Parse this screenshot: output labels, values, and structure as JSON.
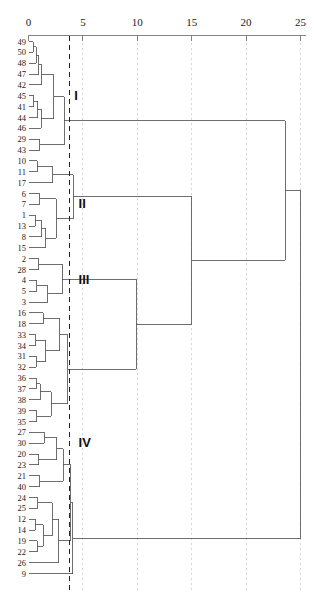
{
  "chart_data": {
    "type": "line",
    "title": "",
    "xlabel": "",
    "ylabel": "",
    "orientation": "horizontal",
    "grid": true,
    "axis_position": "top",
    "xlim": [
      0,
      25.6
    ],
    "axis_ticks": [
      {
        "value": 0,
        "label": "0"
      },
      {
        "value": 5,
        "label": "5"
      },
      {
        "value": 10,
        "label": "10"
      },
      {
        "value": 15,
        "label": "15"
      },
      {
        "value": 20,
        "label": "20"
      },
      {
        "value": 25,
        "label": "25"
      }
    ],
    "leaf_order": [
      "49",
      "50",
      "48",
      "47",
      "42",
      "45",
      "41",
      "44",
      "46",
      "29",
      "43",
      "10",
      "11",
      "17",
      "6",
      "7",
      "1",
      "13",
      "8",
      "15",
      "2",
      "28",
      "4",
      "5",
      "3",
      "16",
      "18",
      "33",
      "34",
      "31",
      "32",
      "36",
      "37",
      "38",
      "39",
      "35",
      "27",
      "30",
      "20",
      "23",
      "21",
      "40",
      "24",
      "25",
      "12",
      "14",
      "19",
      "22",
      "26",
      "9"
    ],
    "n_leaves": 50,
    "cut_line": {
      "value": 3.8,
      "style": "dashed",
      "color": "#222222"
    },
    "cluster_labels": [
      {
        "name": "I",
        "value": 4.2,
        "leaf_span": [
          0,
          10
        ]
      },
      {
        "name": "II",
        "value": 4.6,
        "leaf_span": [
          11,
          19
        ]
      },
      {
        "name": "III",
        "value": 4.6,
        "leaf_span": [
          20,
          24
        ]
      },
      {
        "name": "IV",
        "value": 4.6,
        "leaf_span": [
          25,
          49
        ]
      }
    ],
    "merges": [
      {
        "id": "m1",
        "children": [
          "49",
          "50"
        ],
        "height": 0.45
      },
      {
        "id": "m2",
        "children": [
          "m1",
          "48"
        ],
        "height": 0.7
      },
      {
        "id": "m3",
        "children": [
          "m2",
          "47"
        ],
        "height": 0.95
      },
      {
        "id": "m4",
        "children": [
          "m3",
          "42"
        ],
        "height": 1.2
      },
      {
        "id": "m5",
        "children": [
          "45",
          "41"
        ],
        "height": 0.5
      },
      {
        "id": "m6",
        "children": [
          "m5",
          "44"
        ],
        "height": 0.85
      },
      {
        "id": "m7",
        "children": [
          "m6",
          "46"
        ],
        "height": 1.15
      },
      {
        "id": "m8",
        "children": [
          "m4",
          "m7"
        ],
        "height": 2.3
      },
      {
        "id": "m9",
        "children": [
          "29",
          "43"
        ],
        "height": 1.05
      },
      {
        "id": "m10",
        "children": [
          "m8",
          "m9"
        ],
        "height": 3.3
      },
      {
        "id": "m11",
        "children": [
          "10",
          "11"
        ],
        "height": 0.8
      },
      {
        "id": "m12",
        "children": [
          "m11",
          "17"
        ],
        "height": 2.25
      },
      {
        "id": "m13",
        "children": [
          "6",
          "7"
        ],
        "height": 1.05
      },
      {
        "id": "m14",
        "children": [
          "1",
          "13"
        ],
        "height": 0.6
      },
      {
        "id": "m15",
        "children": [
          "m14",
          "8"
        ],
        "height": 1.2
      },
      {
        "id": "m16",
        "children": [
          "m15",
          "15"
        ],
        "height": 1.6
      },
      {
        "id": "m17",
        "children": [
          "m13",
          "m16"
        ],
        "height": 2.55
      },
      {
        "id": "m18",
        "children": [
          "m12",
          "m17"
        ],
        "height": 4.1
      },
      {
        "id": "m19",
        "children": [
          "2",
          "28"
        ],
        "height": 0.95
      },
      {
        "id": "m20",
        "children": [
          "4",
          "5"
        ],
        "height": 0.75
      },
      {
        "id": "m21",
        "children": [
          "m20",
          "3"
        ],
        "height": 1.75
      },
      {
        "id": "m22",
        "children": [
          "m19",
          "m21"
        ],
        "height": 3.1
      },
      {
        "id": "m23",
        "children": [
          "16",
          "18"
        ],
        "height": 1.35
      },
      {
        "id": "m24",
        "children": [
          "33",
          "34"
        ],
        "height": 0.65
      },
      {
        "id": "m25",
        "children": [
          "31",
          "32"
        ],
        "height": 0.7
      },
      {
        "id": "m26",
        "children": [
          "m24",
          "m25"
        ],
        "height": 1.6
      },
      {
        "id": "m27",
        "children": [
          "m23",
          "m26"
        ],
        "height": 2.85
      },
      {
        "id": "m28",
        "children": [
          "36",
          "37"
        ],
        "height": 0.7
      },
      {
        "id": "m29",
        "children": [
          "m28",
          "38"
        ],
        "height": 1.1
      },
      {
        "id": "m30",
        "children": [
          "39",
          "35"
        ],
        "height": 0.75
      },
      {
        "id": "m31",
        "children": [
          "m29",
          "m30"
        ],
        "height": 2.1
      },
      {
        "id": "m32",
        "children": [
          "m27",
          "m31"
        ],
        "height": 3.6
      },
      {
        "id": "m33",
        "children": [
          "m22",
          "m32"
        ],
        "height": 9.9
      },
      {
        "id": "m34",
        "children": [
          "m18",
          "m33"
        ],
        "height": 15.0
      },
      {
        "id": "m35",
        "children": [
          "27",
          "30"
        ],
        "height": 1.45
      },
      {
        "id": "m36",
        "children": [
          "20",
          "23"
        ],
        "height": 0.95
      },
      {
        "id": "m37",
        "children": [
          "m35",
          "m36"
        ],
        "height": 2.6
      },
      {
        "id": "m38",
        "children": [
          "21",
          "40"
        ],
        "height": 1.05
      },
      {
        "id": "m39",
        "children": [
          "m37",
          "m38"
        ],
        "height": 3.2
      },
      {
        "id": "m40",
        "children": [
          "24",
          "25"
        ],
        "height": 0.85
      },
      {
        "id": "m41",
        "children": [
          "12",
          "14"
        ],
        "height": 0.6
      },
      {
        "id": "m42",
        "children": [
          "19",
          "22"
        ],
        "height": 0.8
      },
      {
        "id": "m43",
        "children": [
          "m41",
          "m42"
        ],
        "height": 1.35
      },
      {
        "id": "m44",
        "children": [
          "m40",
          "m43"
        ],
        "height": 2.2
      },
      {
        "id": "m45",
        "children": [
          "m44",
          "26"
        ],
        "height": 2.8
      },
      {
        "id": "m46",
        "children": [
          "m39",
          "m45"
        ],
        "height": 3.9
      },
      {
        "id": "m47",
        "children": [
          "m46",
          "9"
        ],
        "height": 4.05
      },
      {
        "id": "m48",
        "children": [
          "m10",
          "m34"
        ],
        "height": 23.6
      },
      {
        "id": "m49",
        "children": [
          "m48",
          "m47"
        ],
        "height": 25.0
      }
    ],
    "line_color": "#555555",
    "grid_color": "#cccccc"
  }
}
